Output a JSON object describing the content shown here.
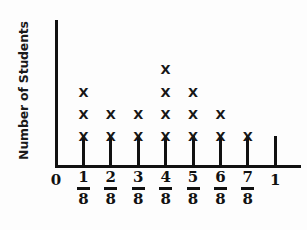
{
  "chart_data": {
    "type": "bar",
    "plot_style": "line-plot-dot-plot",
    "title": "",
    "subtitle": "",
    "xlabel": "",
    "ylabel": "Number of Students",
    "categories": [
      "0",
      "1/8",
      "2/8",
      "3/8",
      "4/8",
      "5/8",
      "6/8",
      "7/8",
      "1"
    ],
    "category_labels": [
      {
        "whole": "0",
        "numerator": "",
        "denominator": ""
      },
      {
        "whole": "",
        "numerator": "1",
        "denominator": "8"
      },
      {
        "whole": "",
        "numerator": "2",
        "denominator": "8"
      },
      {
        "whole": "",
        "numerator": "3",
        "denominator": "8"
      },
      {
        "whole": "",
        "numerator": "4",
        "denominator": "8"
      },
      {
        "whole": "",
        "numerator": "5",
        "denominator": "8"
      },
      {
        "whole": "",
        "numerator": "6",
        "denominator": "8"
      },
      {
        "whole": "",
        "numerator": "7",
        "denominator": "8"
      },
      {
        "whole": "1",
        "numerator": "",
        "denominator": ""
      }
    ],
    "values": [
      0,
      3,
      2,
      2,
      4,
      3,
      2,
      1,
      0
    ],
    "marker": "X",
    "ylim": [
      0,
      5
    ],
    "grid": false,
    "legend": null,
    "axis_color": "#111111",
    "marker_color": "#171717",
    "background_color": "#fdfdfd"
  },
  "axes": {
    "y_title": "Number of Students",
    "origin_label": "0"
  }
}
